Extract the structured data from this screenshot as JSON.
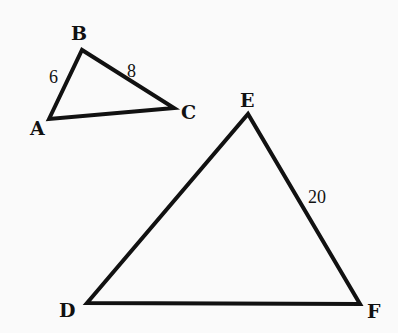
{
  "diagram": {
    "type": "similar-triangles",
    "triangles": [
      {
        "name": "ABC",
        "vertices": [
          {
            "label": "A",
            "x": 49,
            "y": 119,
            "label_x": 30,
            "label_y": 135
          },
          {
            "label": "B",
            "x": 82,
            "y": 50,
            "label_x": 71,
            "label_y": 40
          },
          {
            "label": "C",
            "x": 174,
            "y": 108,
            "label_x": 181,
            "label_y": 119
          }
        ],
        "side_labels": [
          {
            "side": "AB",
            "text": "6",
            "x": 49,
            "y": 83
          },
          {
            "side": "BC",
            "text": "8",
            "x": 127,
            "y": 77
          }
        ]
      },
      {
        "name": "DEF",
        "vertices": [
          {
            "label": "D",
            "x": 87,
            "y": 303,
            "label_x": 59,
            "label_y": 317
          },
          {
            "label": "E",
            "x": 248,
            "y": 114,
            "label_x": 240,
            "label_y": 107
          },
          {
            "label": "F",
            "x": 360,
            "y": 304,
            "label_x": 367,
            "label_y": 318
          }
        ],
        "side_labels": [
          {
            "side": "EF",
            "text": "20",
            "x": 308,
            "y": 203
          }
        ]
      }
    ],
    "labels": {
      "A": "A",
      "B": "B",
      "C": "C",
      "D": "D",
      "E": "E",
      "F": "F",
      "AB": "6",
      "BC": "8",
      "EF": "20"
    }
  }
}
